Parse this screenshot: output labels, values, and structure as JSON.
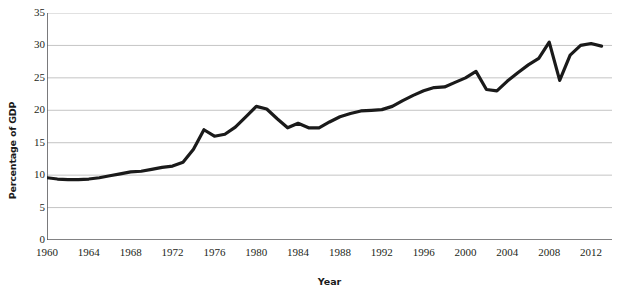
{
  "chart_data": {
    "type": "line",
    "title": "",
    "subtitle": "",
    "xlabel": "Year",
    "ylabel": "Percentage of GDP",
    "xlim": [
      1960,
      2014
    ],
    "ylim": [
      0,
      35
    ],
    "yticks": [
      0,
      5,
      10,
      15,
      20,
      25,
      30,
      35
    ],
    "xticks": [
      1960,
      1964,
      1968,
      1972,
      1976,
      1980,
      1984,
      1988,
      1992,
      1996,
      2000,
      2004,
      2008,
      2012
    ],
    "xtick_minor_step": 2,
    "grid": "horizontal",
    "legend": "none",
    "line_color": "#1a1a1a",
    "grid_color": "#b5b5b5",
    "axis_color": "#58595b",
    "series": [
      {
        "name": "Percentage of GDP",
        "x": [
          1960,
          1961,
          1962,
          1963,
          1964,
          1965,
          1966,
          1967,
          1968,
          1969,
          1970,
          1971,
          1972,
          1973,
          1974,
          1975,
          1976,
          1977,
          1978,
          1979,
          1980,
          1981,
          1982,
          1983,
          1984,
          1985,
          1986,
          1987,
          1988,
          1989,
          1990,
          1991,
          1992,
          1993,
          1994,
          1995,
          1996,
          1997,
          1998,
          1999,
          2000,
          2001,
          2002,
          2003,
          2004,
          2005,
          2006,
          2007,
          2008,
          2009,
          2010,
          2011,
          2012,
          2013
        ],
        "values": [
          9.6,
          9.4,
          9.3,
          9.3,
          9.4,
          9.6,
          9.9,
          10.2,
          10.5,
          10.6,
          10.9,
          11.2,
          11.4,
          12.0,
          14.0,
          17.0,
          16.0,
          16.3,
          17.4,
          19.0,
          20.6,
          20.2,
          18.7,
          17.3,
          18.0,
          17.3,
          17.3,
          18.2,
          19.0,
          19.5,
          19.9,
          20.0,
          20.1,
          20.6,
          21.5,
          22.3,
          23.0,
          23.5,
          23.6,
          24.3,
          25.0,
          26.0,
          23.2,
          23.0,
          24.5,
          25.8,
          27.0,
          28.0,
          30.5,
          24.6,
          28.5,
          30.0,
          30.3,
          29.9
        ]
      }
    ]
  },
  "axes": {
    "y_tick_labels": [
      "0",
      "5",
      "10",
      "15",
      "20",
      "25",
      "30",
      "35"
    ],
    "x_tick_labels": [
      "1960",
      "1964",
      "1968",
      "1972",
      "1976",
      "1980",
      "1984",
      "1988",
      "1992",
      "1996",
      "2000",
      "2004",
      "2008",
      "2012"
    ],
    "y_axis_title": "Percentage of GDP",
    "x_axis_title": "Year"
  }
}
